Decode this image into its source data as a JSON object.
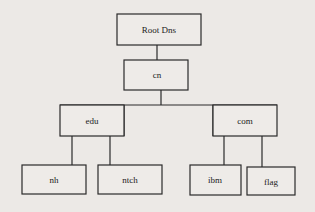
{
  "diagram": {
    "type": "tree",
    "nodes": [
      {
        "id": "root",
        "label": "Root Dns",
        "parent": null
      },
      {
        "id": "cn",
        "label": "cn",
        "parent": "root"
      },
      {
        "id": "edu",
        "label": "edu",
        "parent": "cn"
      },
      {
        "id": "com",
        "label": "com",
        "parent": "cn"
      },
      {
        "id": "nh",
        "label": "nh",
        "parent": "edu"
      },
      {
        "id": "ntch",
        "label": "ntch",
        "parent": "edu"
      },
      {
        "id": "ibm",
        "label": "ibm",
        "parent": "com"
      },
      {
        "id": "flag",
        "label": "flag",
        "parent": "com"
      }
    ]
  }
}
